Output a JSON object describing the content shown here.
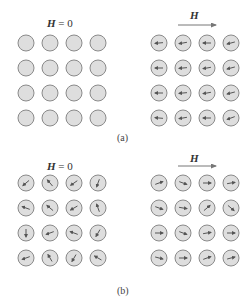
{
  "colors": {
    "circle_fill": "#dedede",
    "circle_stroke": "#8a8a8a",
    "arrow": "#555555"
  },
  "panels": {
    "a": {
      "caption": "(a)",
      "left": {
        "label_var": "H",
        "label_rest": " = 0",
        "arrows": null
      },
      "right": {
        "label_var": "H",
        "field_arrow": true,
        "angles": [
          [
            185,
            190,
            180,
            195
          ],
          [
            180,
            185,
            190,
            195
          ],
          [
            180,
            185,
            190,
            195
          ],
          [
            175,
            190,
            180,
            200
          ]
        ]
      }
    },
    "b": {
      "caption": "(b)",
      "left": {
        "label_var": "H",
        "label_rest": " = 0",
        "angles": [
          [
            220,
            130,
            215,
            250
          ],
          [
            160,
            140,
            210,
            110
          ],
          [
            270,
            200,
            160,
            240
          ],
          [
            200,
            120,
            240,
            150
          ]
        ]
      },
      "right": {
        "label_var": "H",
        "field_arrow": true,
        "angles": [
          [
            20,
            340,
            0,
            10
          ],
          [
            340,
            350,
            40,
            320
          ],
          [
            0,
            340,
            10,
            0
          ],
          [
            345,
            0,
            20,
            15
          ]
        ]
      }
    }
  }
}
